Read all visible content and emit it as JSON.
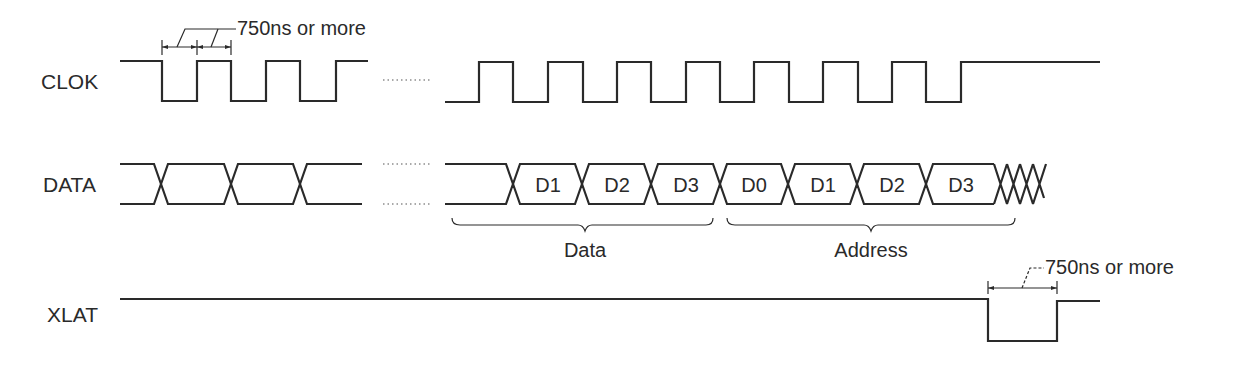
{
  "diagram": {
    "type": "timing-diagram",
    "signals": [
      {
        "name": "CLOK",
        "label": "CLOK"
      },
      {
        "name": "DATA",
        "label": "DATA"
      },
      {
        "name": "XLAT",
        "label": "XLAT"
      }
    ],
    "data_cells": [
      "D1",
      "D2",
      "D3",
      "D0",
      "D1",
      "D2",
      "D3"
    ],
    "groups": [
      {
        "label": "Data",
        "cells": [
          "D1",
          "D2",
          "D3"
        ]
      },
      {
        "label": "Address",
        "cells": [
          "D0",
          "D1",
          "D2",
          "D3"
        ]
      }
    ],
    "annotations": {
      "clock_timing": "750ns or more",
      "latch_timing": "750ns or more"
    },
    "colors": {
      "ink": "#2a2a2a",
      "background": "#ffffff"
    }
  }
}
